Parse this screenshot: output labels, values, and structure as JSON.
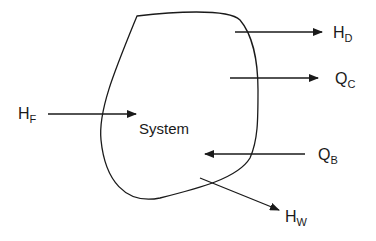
{
  "diagram": {
    "system_label": "System",
    "colors": {
      "line": "#1a1a1a",
      "background": "#ffffff"
    },
    "boundary": {
      "shape": "closed-blob",
      "name": "system-boundary"
    },
    "streams": [
      {
        "id": "HF",
        "main": "H",
        "sub": "F",
        "direction": "in",
        "description": "feed enthalpy into system"
      },
      {
        "id": "HD",
        "main": "H",
        "sub": "D",
        "direction": "out",
        "description": "distillate enthalpy out of system"
      },
      {
        "id": "QC",
        "main": "Q",
        "sub": "C",
        "direction": "out",
        "description": "condenser heat removed"
      },
      {
        "id": "QB",
        "main": "Q",
        "sub": "B",
        "direction": "in",
        "description": "reboiler heat added"
      },
      {
        "id": "HW",
        "main": "H",
        "sub": "W",
        "direction": "out",
        "description": "bottoms enthalpy out of system"
      }
    ]
  }
}
